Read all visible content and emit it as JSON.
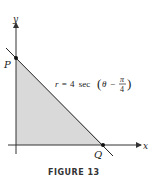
{
  "figure": {
    "caption": "FIGURE 13",
    "axes": {
      "x_label": "x",
      "y_label": "y"
    },
    "points": {
      "P": "P",
      "Q": "Q"
    },
    "equation": {
      "lhs": "r",
      "eq": "=",
      "coef": "4",
      "func": "sec",
      "theta": "θ",
      "minus": "−",
      "num": "π",
      "den": "4"
    },
    "colors": {
      "shade": "#d9d9d9",
      "line": "#222222",
      "axis": "#333333"
    }
  }
}
